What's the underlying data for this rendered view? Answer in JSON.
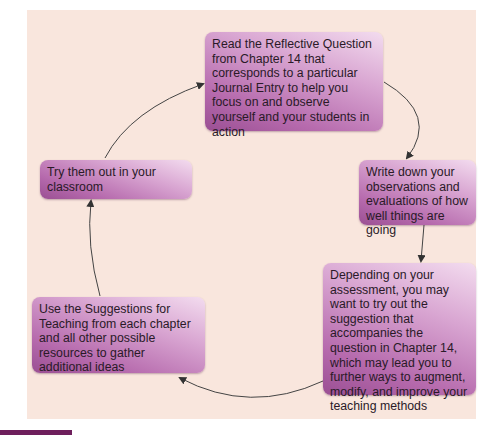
{
  "diagram": {
    "type": "cycle",
    "colors": {
      "panel_background": "#f9e6dd",
      "box_gradient_light": "#f3dcef",
      "box_gradient_dark": "#9a4f93",
      "arrow": "#333333",
      "caption_block": "#6e1f5c"
    },
    "steps": [
      {
        "id": "read",
        "text": "Read the Reflective Question from Chapter 14 that corresponds to a particular Journal Entry to help you focus on and observe yourself and your students in action"
      },
      {
        "id": "write",
        "text": "Write down your observations and evaluations of how well things are going"
      },
      {
        "id": "depending",
        "text": "Depending on your assessment, you may want to try out the suggestion that accompanies the question in Chapter 14, which may lead you to further ways to augment, modify, and improve your teaching methods"
      },
      {
        "id": "use",
        "text": "Use the Suggestions for Teaching from each chapter and all other possible resources to gather additional ideas"
      },
      {
        "id": "try",
        "text": "Try them out in your classroom"
      }
    ],
    "edges": [
      {
        "from": "read",
        "to": "write"
      },
      {
        "from": "write",
        "to": "depending"
      },
      {
        "from": "depending",
        "to": "use"
      },
      {
        "from": "use",
        "to": "try"
      },
      {
        "from": "try",
        "to": "read"
      }
    ]
  }
}
